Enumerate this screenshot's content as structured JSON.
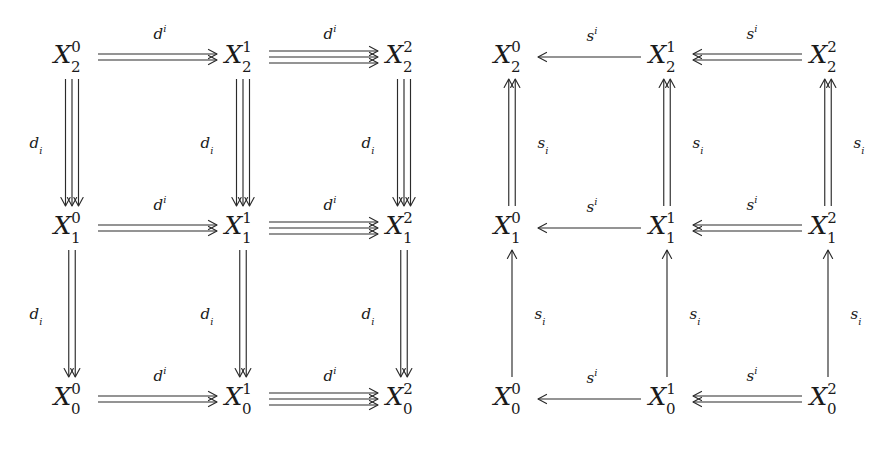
{
  "figure": {
    "kind": "commutative-diagram-pair",
    "background_color": "#ffffff",
    "ink_color": "#2b2b2b",
    "width": 874,
    "height": 451
  },
  "left_diagram": {
    "name": "face-maps-diagram",
    "direction_horizontal": "right",
    "direction_vertical": "down",
    "horizontal_label": "d",
    "horizontal_label_index": "i",
    "horizontal_index_position": "superscript",
    "vertical_label": "d",
    "vertical_label_index": "i",
    "vertical_index_position": "subscript",
    "vertical_label_side": "left",
    "columns": [
      "0",
      "1",
      "2"
    ],
    "rows": [
      "2",
      "1",
      "0"
    ],
    "nodes": [
      {
        "id": "n-2-0",
        "base": "X",
        "sub": "2",
        "sup": "0",
        "x": 72,
        "y": 57
      },
      {
        "id": "n-2-1",
        "base": "X",
        "sub": "2",
        "sup": "1",
        "x": 243,
        "y": 57
      },
      {
        "id": "n-2-2",
        "base": "X",
        "sub": "2",
        "sup": "2",
        "x": 404,
        "y": 57
      },
      {
        "id": "n-1-0",
        "base": "X",
        "sub": "1",
        "sup": "0",
        "x": 72,
        "y": 228
      },
      {
        "id": "n-1-1",
        "base": "X",
        "sub": "1",
        "sup": "1",
        "x": 243,
        "y": 228
      },
      {
        "id": "n-1-2",
        "base": "X",
        "sub": "1",
        "sup": "2",
        "x": 404,
        "y": 228
      },
      {
        "id": "n-0-0",
        "base": "X",
        "sub": "0",
        "sup": "0",
        "x": 72,
        "y": 399
      },
      {
        "id": "n-0-1",
        "base": "X",
        "sub": "0",
        "sup": "1",
        "x": 243,
        "y": 399
      },
      {
        "id": "n-0-2",
        "base": "X",
        "sub": "0",
        "sup": "2",
        "x": 404,
        "y": 399
      }
    ],
    "horizontal_edges": [
      {
        "id": "h-top-a",
        "row": "2",
        "from": "0",
        "to": "1",
        "multiplicity": 2,
        "label_x": 160,
        "label_y": 33
      },
      {
        "id": "h-top-b",
        "row": "2",
        "from": "1",
        "to": "2",
        "multiplicity": 3,
        "label_x": 330,
        "label_y": 33
      },
      {
        "id": "h-mid-a",
        "row": "1",
        "from": "0",
        "to": "1",
        "multiplicity": 2,
        "label_x": 160,
        "label_y": 204
      },
      {
        "id": "h-mid-b",
        "row": "1",
        "from": "1",
        "to": "2",
        "multiplicity": 3,
        "label_x": 330,
        "label_y": 204
      },
      {
        "id": "h-bot-a",
        "row": "0",
        "from": "0",
        "to": "1",
        "multiplicity": 2,
        "label_x": 160,
        "label_y": 375
      },
      {
        "id": "h-bot-b",
        "row": "0",
        "from": "1",
        "to": "2",
        "multiplicity": 3,
        "label_x": 330,
        "label_y": 375
      }
    ],
    "vertical_edges": [
      {
        "id": "v-c0-upper",
        "col": "0",
        "multiplicity": 3,
        "label_x": 36,
        "label_y": 145
      },
      {
        "id": "v-c1-upper",
        "col": "1",
        "multiplicity": 3,
        "label_x": 207,
        "label_y": 145
      },
      {
        "id": "v-c2-upper",
        "col": "2",
        "multiplicity": 3,
        "label_x": 368,
        "label_y": 145
      },
      {
        "id": "v-c0-lower",
        "col": "0",
        "multiplicity": 2,
        "label_x": 36,
        "label_y": 316
      },
      {
        "id": "v-c1-lower",
        "col": "1",
        "multiplicity": 2,
        "label_x": 207,
        "label_y": 316
      },
      {
        "id": "v-c2-lower",
        "col": "2",
        "multiplicity": 2,
        "label_x": 368,
        "label_y": 316
      }
    ]
  },
  "right_diagram": {
    "name": "degeneracy-maps-diagram",
    "direction_horizontal": "left",
    "direction_vertical": "up",
    "horizontal_label": "s",
    "horizontal_label_index": "i",
    "horizontal_index_position": "superscript",
    "vertical_label": "s",
    "vertical_label_index": "i",
    "vertical_index_position": "subscript",
    "vertical_label_side": "right",
    "columns": [
      "0",
      "1",
      "2"
    ],
    "rows": [
      "2",
      "1",
      "0"
    ],
    "nodes": [
      {
        "id": "m-2-0",
        "base": "X",
        "sub": "2",
        "sup": "0",
        "x": 512,
        "y": 57
      },
      {
        "id": "m-2-1",
        "base": "X",
        "sub": "2",
        "sup": "1",
        "x": 667,
        "y": 57
      },
      {
        "id": "m-2-2",
        "base": "X",
        "sub": "2",
        "sup": "2",
        "x": 828,
        "y": 57
      },
      {
        "id": "m-1-0",
        "base": "X",
        "sub": "1",
        "sup": "0",
        "x": 512,
        "y": 228
      },
      {
        "id": "m-1-1",
        "base": "X",
        "sub": "1",
        "sup": "1",
        "x": 667,
        "y": 228
      },
      {
        "id": "m-1-2",
        "base": "X",
        "sub": "1",
        "sup": "2",
        "x": 828,
        "y": 228
      },
      {
        "id": "m-0-0",
        "base": "X",
        "sub": "0",
        "sup": "0",
        "x": 512,
        "y": 399
      },
      {
        "id": "m-0-1",
        "base": "X",
        "sub": "0",
        "sup": "1",
        "x": 667,
        "y": 399
      },
      {
        "id": "m-0-2",
        "base": "X",
        "sub": "0",
        "sup": "2",
        "x": 828,
        "y": 399
      }
    ],
    "horizontal_edges": [
      {
        "id": "rh-top-a",
        "row": "2",
        "from": "1",
        "to": "0",
        "multiplicity": 1,
        "label_x": 592,
        "label_y": 35
      },
      {
        "id": "rh-top-b",
        "row": "2",
        "from": "2",
        "to": "1",
        "multiplicity": 2,
        "label_x": 752,
        "label_y": 33
      },
      {
        "id": "rh-mid-a",
        "row": "1",
        "from": "1",
        "to": "0",
        "multiplicity": 1,
        "label_x": 592,
        "label_y": 206
      },
      {
        "id": "rh-mid-b",
        "row": "1",
        "from": "2",
        "to": "1",
        "multiplicity": 2,
        "label_x": 752,
        "label_y": 204
      },
      {
        "id": "rh-bot-a",
        "row": "0",
        "from": "1",
        "to": "0",
        "multiplicity": 1,
        "label_x": 592,
        "label_y": 377
      },
      {
        "id": "rh-bot-b",
        "row": "0",
        "from": "2",
        "to": "1",
        "multiplicity": 2,
        "label_x": 752,
        "label_y": 375
      }
    ],
    "vertical_edges": [
      {
        "id": "rv-c0-upper",
        "col": "0",
        "multiplicity": 2,
        "label_x": 543,
        "label_y": 145
      },
      {
        "id": "rv-c1-upper",
        "col": "1",
        "multiplicity": 2,
        "label_x": 698,
        "label_y": 145
      },
      {
        "id": "rv-c2-upper",
        "col": "2",
        "multiplicity": 2,
        "label_x": 859,
        "label_y": 145
      },
      {
        "id": "rv-c0-lower",
        "col": "0",
        "multiplicity": 1,
        "label_x": 540,
        "label_y": 316
      },
      {
        "id": "rv-c1-lower",
        "col": "1",
        "multiplicity": 1,
        "label_x": 695,
        "label_y": 316
      },
      {
        "id": "rv-c2-lower",
        "col": "2",
        "multiplicity": 1,
        "label_x": 856,
        "label_y": 316
      }
    ]
  }
}
